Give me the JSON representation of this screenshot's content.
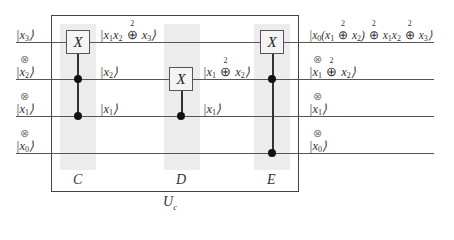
{
  "diagram": {
    "type": "quantum-circuit",
    "frame_label": "U",
    "frame_label_sub": "c",
    "gates": [
      {
        "id": "C",
        "label": "C",
        "target_symbol": "X",
        "target_wire": "x3",
        "controls": [
          "x2",
          "x1"
        ]
      },
      {
        "id": "D",
        "label": "D",
        "target_symbol": "X",
        "target_wire": "x2",
        "controls": [
          "x1"
        ]
      },
      {
        "id": "E",
        "label": "E",
        "target_symbol": "X",
        "target_wire": "x3",
        "controls": [
          "x2",
          "x0"
        ]
      }
    ],
    "tensor_symbol": "⊗",
    "oplus_modulus": "2",
    "inputs": [
      {
        "wire": "x3",
        "var": "x",
        "sub": "3"
      },
      {
        "wire": "x2",
        "var": "x",
        "sub": "2"
      },
      {
        "wire": "x1",
        "var": "x",
        "sub": "1"
      },
      {
        "wire": "x0",
        "var": "x",
        "sub": "0"
      }
    ],
    "intermediate_after_C": {
      "x3": "|x1x2 ⊕2 x3⟩",
      "x2": "|x2⟩",
      "x1": "|x1⟩"
    },
    "intermediate_after_D": {
      "x2": "|x1 ⊕2 x2⟩",
      "x1": "|x1⟩"
    },
    "outputs": {
      "x3": "|x0(x1 ⊕2 x2) ⊕2 x1x2 ⊕2 x3⟩",
      "x2": "|x1 ⊕2 x2⟩",
      "x1": "|x1⟩",
      "x0": "|x0⟩"
    }
  }
}
